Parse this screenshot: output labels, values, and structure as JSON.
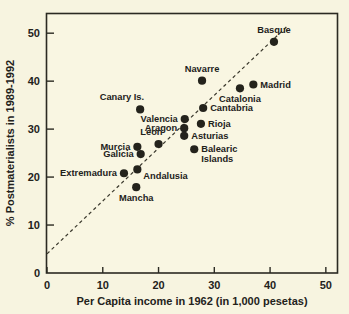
{
  "figure": {
    "background_color": "#f7f4e0",
    "ink_color": "#24231c"
  },
  "chart_data": {
    "type": "scatter",
    "title": "",
    "xlabel": "Per Capita income in 1962 (in 1,000 pesetas)",
    "ylabel": "% Postmaterialists in 1989-1992",
    "xlim": [
      0,
      52
    ],
    "ylim": [
      0,
      54
    ],
    "xticks": [
      0,
      10,
      20,
      30,
      40,
      50
    ],
    "yticks": [
      0,
      10,
      20,
      30,
      40,
      50
    ],
    "xticklabels": [
      "0",
      "10",
      "20",
      "30",
      "40",
      "50"
    ],
    "yticklabels": [
      "0",
      "10",
      "20",
      "30",
      "40",
      "50"
    ],
    "grid": false,
    "legend": "none",
    "marker": "filled-circle",
    "points": [
      {
        "label": "Basque",
        "x": 40.7,
        "y": 48.2,
        "label_pos": "above"
      },
      {
        "label": "Navarre",
        "x": 27.8,
        "y": 40.1,
        "label_pos": "above"
      },
      {
        "label": "Madrid",
        "x": 37.0,
        "y": 39.3,
        "label_pos": "right"
      },
      {
        "label": "Catalonia",
        "x": 34.6,
        "y": 38.5,
        "label_pos": "below"
      },
      {
        "label": "Canary Is.",
        "x": 16.7,
        "y": 34.1,
        "label_pos": "above-left"
      },
      {
        "label": "Cantabria",
        "x": 28.0,
        "y": 34.4,
        "label_pos": "right"
      },
      {
        "label": "Valencia",
        "x": 24.7,
        "y": 32.1,
        "label_pos": "left"
      },
      {
        "label": "Rioja",
        "x": 27.6,
        "y": 31.1,
        "label_pos": "right"
      },
      {
        "label": "Aragon",
        "x": 24.6,
        "y": 30.2,
        "label_pos": "left"
      },
      {
        "label": "Asturias",
        "x": 24.6,
        "y": 28.6,
        "label_pos": "right"
      },
      {
        "label": "Leon",
        "x": 20.0,
        "y": 26.9,
        "label_pos": "above-left"
      },
      {
        "label": "Murcia",
        "x": 16.2,
        "y": 26.3,
        "label_pos": "left"
      },
      {
        "label": "Balearic Islands",
        "x": 26.4,
        "y": 25.8,
        "label_pos": "right",
        "wrap": "Balearic|Islands"
      },
      {
        "label": "Galicia",
        "x": 16.8,
        "y": 24.8,
        "label_pos": "left"
      },
      {
        "label": "Andalusia",
        "x": 16.2,
        "y": 21.6,
        "label_pos": "below-right"
      },
      {
        "label": "Extremadura",
        "x": 13.8,
        "y": 20.8,
        "label_pos": "left"
      },
      {
        "label": "Mancha",
        "x": 16.0,
        "y": 17.9,
        "label_pos": "below"
      }
    ],
    "trend_line": {
      "style": "dashed",
      "x_start": 0.0,
      "y_start": 4.0,
      "x_end": 43.2,
      "y_end": 51.6
    }
  }
}
